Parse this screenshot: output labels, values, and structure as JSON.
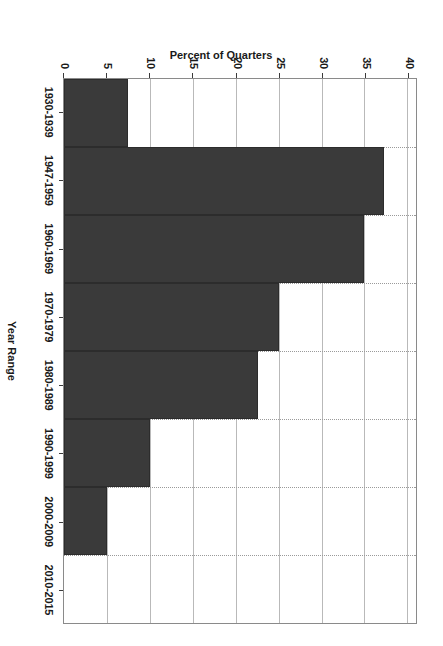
{
  "chart_data": {
    "type": "bar",
    "orientation": "vertical-rendered-rotated-90",
    "title": "",
    "xlabel": "Year Range",
    "ylabel": "Percent of Quarters",
    "categories": [
      "1930-1939",
      "1947-1959",
      "1960-1969",
      "1970-1979",
      "1980-1989",
      "1990-1999",
      "2000-2009",
      "2010-2015"
    ],
    "values": [
      7.5,
      37.3,
      35.0,
      25.0,
      22.6,
      10.0,
      5.0,
      0.0
    ],
    "ylim": [
      0,
      41
    ],
    "yticks": [
      0,
      5,
      10,
      15,
      20,
      25,
      30,
      35,
      40
    ],
    "ytick_labels": [
      "0",
      "5",
      "10",
      "15",
      "20",
      "25",
      "30",
      "35",
      "40"
    ],
    "grid": true,
    "legend": false,
    "bar_color": "#3a3a3a"
  },
  "axes": {
    "value_axis_title": "Percent of Quarters",
    "category_axis_title": "Year Range"
  }
}
